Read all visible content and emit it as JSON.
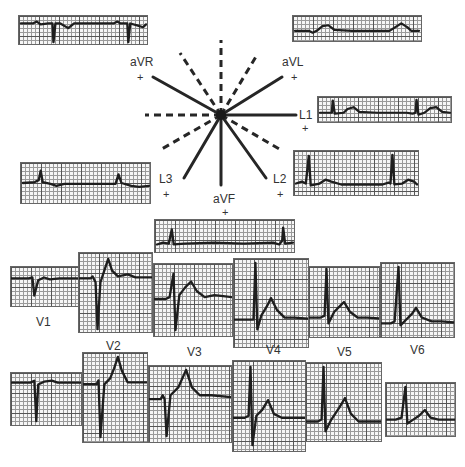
{
  "figure": {
    "type": "ECG hexaxial reference system with 12-lead tracings",
    "hexaxial": {
      "center": [
        221,
        115
      ],
      "positive_leads": [
        {
          "name": "L1",
          "angle_deg": 0,
          "label": "L1",
          "plus": "+"
        },
        {
          "name": "aVL",
          "angle_deg": -30,
          "label": "aVL",
          "plus": "+"
        },
        {
          "name": "aVR",
          "angle_deg": -150,
          "label": "aVR",
          "plus": "+"
        },
        {
          "name": "L2",
          "angle_deg": 60,
          "label": "L2",
          "plus": "+"
        },
        {
          "name": "aVF",
          "angle_deg": 90,
          "label": "aVF",
          "plus": "+"
        },
        {
          "name": "L3",
          "angle_deg": 120,
          "label": "L3",
          "plus": "+"
        }
      ],
      "negative_axes_dashed": [
        180,
        150,
        30,
        -90,
        -120,
        -60
      ]
    },
    "limb_leads": [
      {
        "lead": "aVR",
        "label": "aVR"
      },
      {
        "lead": "aVL",
        "label": "aVL"
      },
      {
        "lead": "L1",
        "label": "L1"
      },
      {
        "lead": "L2",
        "label": "L2"
      },
      {
        "lead": "L3",
        "label": "L3"
      },
      {
        "lead": "aVF",
        "label": "aVF"
      }
    ],
    "precordial_labels": [
      "V1",
      "V2",
      "V3",
      "V4",
      "V5",
      "V6"
    ]
  },
  "labels": {
    "aVR": "aVR",
    "aVL": "aVL",
    "L1": "L1",
    "L2": "L2",
    "L3": "L3",
    "aVF": "aVF",
    "plus": "+",
    "V1": "V1",
    "V2": "V2",
    "V3": "V3",
    "V4": "V4",
    "V5": "V5",
    "V6": "V6"
  }
}
